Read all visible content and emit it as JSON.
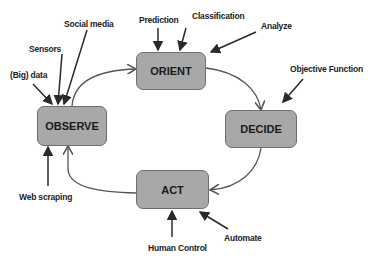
{
  "diagram": {
    "type": "OODA loop",
    "nodes": [
      {
        "id": "orient",
        "label": "ORIENT"
      },
      {
        "id": "decide",
        "label": "DECIDE"
      },
      {
        "id": "act",
        "label": "ACT"
      },
      {
        "id": "observe",
        "label": "OBSERVE"
      }
    ],
    "inputs": {
      "observe": [
        "(Big) data",
        "Sensors",
        "Social media",
        "Web scraping"
      ],
      "orient": [
        "Prediction",
        "Classification",
        "Analyze"
      ],
      "decide": [
        "Objective Function"
      ],
      "act": [
        "Human Control",
        "Automate"
      ]
    },
    "cycle": [
      "OBSERVE",
      "ORIENT",
      "DECIDE",
      "ACT",
      "OBSERVE"
    ],
    "colors": {
      "box_fill": "#a8a8a8",
      "box_border": "#6e6e6e",
      "arrow": "#2a2a2a",
      "text": "#1a1a1a"
    }
  }
}
